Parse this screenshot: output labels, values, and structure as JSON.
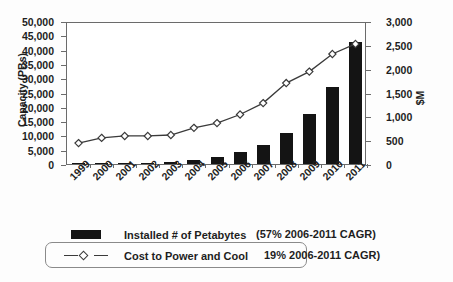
{
  "chart_data": {
    "type": "bar",
    "title": "",
    "subtitle": "",
    "xlabel": "",
    "ylabel": "Capacity (PBs)",
    "y2label": "$M",
    "categories": [
      "1999",
      "2000",
      "2001",
      "2002",
      "2003",
      "2004",
      "2005",
      "2006",
      "2007",
      "2008",
      "2009",
      "2010",
      "2011"
    ],
    "ylim": [
      0,
      50000
    ],
    "y2lim": [
      0,
      3000
    ],
    "yticks": [
      "0",
      "5,000",
      "10,000",
      "15,000",
      "20,000",
      "25,000",
      "30,000",
      "35,000",
      "40,000",
      "45,000",
      "50,000"
    ],
    "y2ticks": [
      "0",
      "500",
      "1,000",
      "1,500",
      "2,000",
      "2,500",
      "3,000"
    ],
    "grid": false,
    "legend_position": "bottom",
    "series": [
      {
        "name": "Installed # of Petabytes",
        "type": "bar",
        "axis": "left",
        "unit": "PBs",
        "color": "#141414",
        "note": "(57% 2006-2011 CAGR)",
        "values": [
          120,
          180,
          300,
          450,
          800,
          1300,
          2400,
          4200,
          6800,
          11000,
          17500,
          27000,
          42500
        ]
      },
      {
        "name": "Cost to Power and Cool",
        "type": "line",
        "axis": "right",
        "unit": "$M",
        "color": "#3a3a3a",
        "marker": "diamond",
        "note": "19% 2006-2011 CAGR)",
        "values": [
          480,
          590,
          630,
          630,
          650,
          800,
          900,
          1080,
          1320,
          1740,
          1980,
          2350,
          2560
        ]
      }
    ]
  },
  "axes": {
    "left_title": "Capacity (PBs)",
    "right_title": "$M"
  },
  "legend": {
    "bars_label": "Installed # of Petabytes",
    "bars_note": "(57% 2006-2011 CAGR)",
    "line_label": "Cost to Power and Cool",
    "line_note": "19% 2006-2011 CAGR)"
  }
}
